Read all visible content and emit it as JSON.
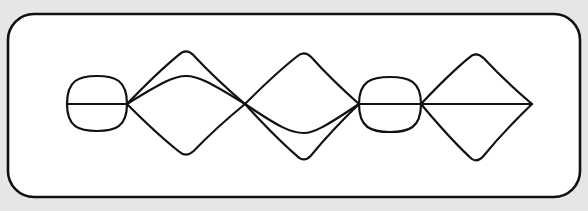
{
  "diagram": {
    "background": "#e6e6e6",
    "panel": {
      "x": 8,
      "y": 14,
      "width": 572,
      "height": 183,
      "radius": 26,
      "fill": "#ffffff",
      "stroke": "#111111"
    },
    "stroke_color": "#111111",
    "stroke_width": 2.2,
    "baseline_y": 104,
    "nodes": [
      {
        "id": "n0",
        "x": 67,
        "y": 104
      },
      {
        "id": "n1",
        "x": 127,
        "y": 104
      },
      {
        "id": "n2",
        "x": 245,
        "y": 104
      },
      {
        "id": "n3",
        "x": 359,
        "y": 104
      },
      {
        "id": "n4",
        "x": 421,
        "y": 104
      },
      {
        "id": "n5",
        "x": 532,
        "y": 104
      }
    ],
    "loops": [
      {
        "name": "left-bubble",
        "from": "n0",
        "to": "n1",
        "top_y": 76,
        "bottom_y": 131,
        "has_chord": true
      },
      {
        "name": "right-bubble",
        "from": "n3",
        "to": "n4",
        "top_y": 77,
        "bottom_y": 132,
        "has_chord": true
      }
    ],
    "diamonds": [
      {
        "name": "diamond-1",
        "from": "n1",
        "to": "n2",
        "apex_x": 186,
        "top_y": 48,
        "bottom_y": 158,
        "inner_arc_y": 76
      },
      {
        "name": "diamond-2",
        "from": "n2",
        "to": "n3",
        "apex_x": 304,
        "top_y": 50,
        "bottom_y": 163,
        "inner_arc_y": 133
      },
      {
        "name": "diamond-3",
        "from": "n4",
        "to": "n5",
        "apex_x": 476,
        "top_y": 51,
        "bottom_y": 164,
        "has_chord": true
      }
    ]
  }
}
